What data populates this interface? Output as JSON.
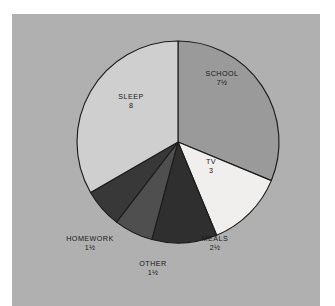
{
  "figure": {
    "panel_background": "#b0b0b0",
    "page_background": "#ffffff",
    "outline_color": "#1c1c1c"
  },
  "chart_data": {
    "type": "pie",
    "title": "",
    "subtitle": "",
    "xlabel": "",
    "ylabel": "",
    "units": "hours",
    "total": 24,
    "start_angle_deg": 0,
    "direction": "clockwise",
    "grid": false,
    "legend": "none",
    "labels_show_name_and_value": true,
    "categories": [
      "SCHOOL",
      "TV",
      "MEALS",
      "OTHER",
      "HOMEWORK",
      "SLEEP"
    ],
    "values": [
      7.5,
      3,
      2.5,
      1.5,
      1.5,
      8
    ],
    "value_labels": [
      "7½",
      "3",
      "2½",
      "1½",
      "1½",
      "8"
    ],
    "colors": [
      "#9a9a9a",
      "#f0efed",
      "#2f2f2f",
      "#4f4f4f",
      "#383838",
      "#cfcfcf"
    ],
    "slices": [
      {
        "name": "SCHOOL",
        "value": 7.5,
        "value_label": "7½",
        "color": "#9a9a9a",
        "start_deg": 0,
        "sweep_deg": 112.5,
        "label_position": "inside",
        "label_tone": "on-light",
        "label_x": 222,
        "label_y": 78
      },
      {
        "name": "TV",
        "value": 3,
        "value_label": "3",
        "color": "#f0efed",
        "start_deg": 112.5,
        "sweep_deg": 45,
        "label_position": "inside",
        "label_tone": "on-light",
        "label_x": 211,
        "label_y": 166
      },
      {
        "name": "MEALS",
        "value": 2.5,
        "value_label": "2½",
        "color": "#2f2f2f",
        "start_deg": 157.5,
        "sweep_deg": 37.5,
        "label_position": "outside",
        "label_tone": "outside",
        "label_x": 215,
        "label_y": 243
      },
      {
        "name": "OTHER",
        "value": 1.5,
        "value_label": "1½",
        "color": "#4f4f4f",
        "start_deg": 195,
        "sweep_deg": 22.5,
        "label_position": "outside",
        "label_tone": "outside",
        "label_x": 153,
        "label_y": 268
      },
      {
        "name": "HOMEWORK",
        "value": 1.5,
        "value_label": "1½",
        "color": "#383838",
        "start_deg": 217.5,
        "sweep_deg": 22.5,
        "label_position": "outside",
        "label_tone": "outside",
        "label_x": 90,
        "label_y": 243
      },
      {
        "name": "SLEEP",
        "value": 8,
        "value_label": "8",
        "color": "#cfcfcf",
        "start_deg": 240,
        "sweep_deg": 120,
        "label_position": "inside",
        "label_tone": "on-light",
        "label_x": 131,
        "label_y": 101
      }
    ],
    "geometry": {
      "center_x": 178,
      "center_y": 142,
      "radius": 101
    }
  }
}
